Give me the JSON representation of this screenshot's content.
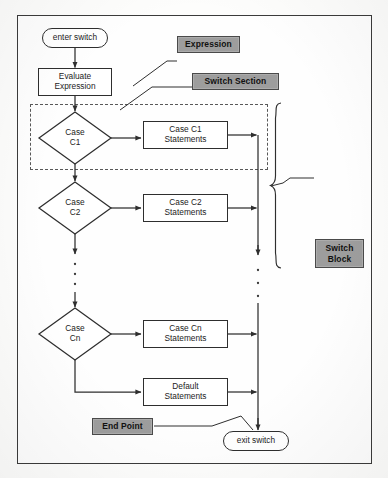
{
  "diagram": {
    "frame": {
      "name": "outer-border"
    },
    "nodes": {
      "enter": {
        "label": "enter switch",
        "shape": "terminator"
      },
      "evaluate": {
        "label": "Evaluate\nExpression",
        "shape": "process"
      },
      "case_c1": {
        "label": "Case\nC1",
        "shape": "decision"
      },
      "case_c1_statements": {
        "label": "Case C1\nStatements",
        "shape": "process"
      },
      "case_c2": {
        "label": "Case\nC2",
        "shape": "decision"
      },
      "case_c2_statements": {
        "label": "Case C2\nStatements",
        "shape": "process"
      },
      "case_cn": {
        "label": "Case\nCn",
        "shape": "decision"
      },
      "case_cn_statements": {
        "label": "Case Cn\nStatements",
        "shape": "process"
      },
      "default_statements": {
        "label": "Default\nStatements",
        "shape": "process"
      },
      "exit": {
        "label": "exit switch",
        "shape": "terminator"
      }
    },
    "callouts": {
      "expression": {
        "label": "Expression"
      },
      "switch_section": {
        "label": "Switch Section"
      },
      "switch_block": {
        "label": "Switch\nBlock"
      },
      "end_point": {
        "label": "End Point"
      }
    },
    "regions": {
      "switch_section_dashed": {
        "name": "switch-section-dashed-outline"
      }
    },
    "ellipsis": {
      "left_column": "vertical-dots",
      "right_rail": "vertical-dots"
    },
    "colors": {
      "callout_fill": "#9d9d9d",
      "stroke": "#2e2e2e",
      "frame_stroke": "#3b3b3b",
      "dashed_stroke": "#585858",
      "page_background": "#fdfdfc",
      "node_fill": "#ffffff"
    }
  }
}
